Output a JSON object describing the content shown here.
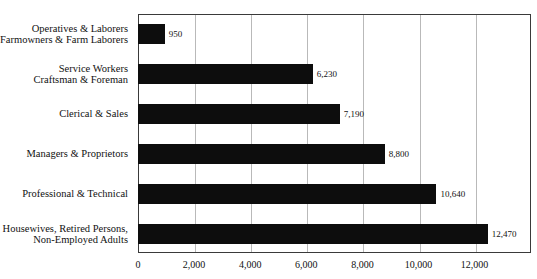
{
  "chart_data": {
    "type": "bar",
    "orientation": "horizontal",
    "title": "",
    "xlabel": "",
    "ylabel": "",
    "xlim": [
      0,
      14000
    ],
    "xticks": [
      0,
      2000,
      4000,
      6000,
      8000,
      10000,
      12000
    ],
    "xtick_labels": [
      "0",
      "2,000",
      "4,000",
      "6,000",
      "8,000",
      "10,000",
      "12,000"
    ],
    "grid": true,
    "grid_axis": "x",
    "legend": false,
    "bar_color": "#0d0d0d",
    "categories": [
      "Operatives & Laborers\nFarmowners & Farm Laborers",
      "Service Workers\nCraftsman & Foreman",
      "Clerical & Sales",
      "Managers & Proprietors",
      "Professional & Technical",
      "Housewives, Retired Persons,\nNon-Employed Adults"
    ],
    "values": [
      950,
      6230,
      7190,
      8800,
      10640,
      12470
    ],
    "value_labels": [
      "950",
      "6,230",
      "7,190",
      "8,800",
      "10,640",
      "12,470"
    ]
  },
  "categories": [
    {
      "line1": "Operatives & Laborers",
      "line2": "Farmowners & Farm Laborers",
      "value": 950,
      "value_label": "950"
    },
    {
      "line1": "Service Workers",
      "line2": "Craftsman & Foreman",
      "value": 6230,
      "value_label": "6,230"
    },
    {
      "line1": "Clerical & Sales",
      "line2": "",
      "value": 7190,
      "value_label": "7,190"
    },
    {
      "line1": "Managers & Proprietors",
      "line2": "",
      "value": 8800,
      "value_label": "8,800"
    },
    {
      "line1": "Professional & Technical",
      "line2": "",
      "value": 10640,
      "value_label": "10,640"
    },
    {
      "line1": "Housewives, Retired Persons,",
      "line2": "Non-Employed Adults",
      "value": 12470,
      "value_label": "12,470"
    }
  ],
  "xaxis": {
    "ticks": [
      {
        "label": "0",
        "value": 0
      },
      {
        "label": "2,000",
        "value": 2000
      },
      {
        "label": "4,000",
        "value": 4000
      },
      {
        "label": "6,000",
        "value": 6000
      },
      {
        "label": "8,000",
        "value": 8000
      },
      {
        "label": "10,000",
        "value": 10000
      },
      {
        "label": "12,000",
        "value": 12000
      }
    ]
  },
  "colors": {
    "bar": "#0d0d0d",
    "frame": "#3a3a3a",
    "grid": "#b9b9b9",
    "text": "#111111",
    "background": "#ffffff"
  }
}
